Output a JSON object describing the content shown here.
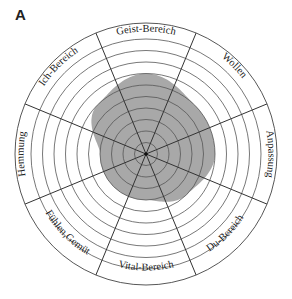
{
  "panel_label": "A",
  "diagram": {
    "type": "radial-profile",
    "center": [
      146,
      154
    ],
    "outer_radius": 131,
    "grid_radius": 115,
    "ring_count": 10,
    "shade_color": "#a8a8a8",
    "line_color": "#333333",
    "segments": [
      {
        "label": "Geist-Bereich",
        "shaded_rings": 7
      },
      {
        "label": "Wollen",
        "shaded_rings": 6
      },
      {
        "label": "Anpassung",
        "shaded_rings": 6
      },
      {
        "label": "Du-Bereich",
        "shaded_rings": 5
      },
      {
        "label": "Vital-Bereich",
        "shaded_rings": 4
      },
      {
        "label": "Fühlen,Gemüt",
        "shaded_rings": 4
      },
      {
        "label": "Hemmung",
        "shaded_rings": 4
      },
      {
        "label": "Ich-Bereich",
        "shaded_rings": 6
      }
    ]
  }
}
